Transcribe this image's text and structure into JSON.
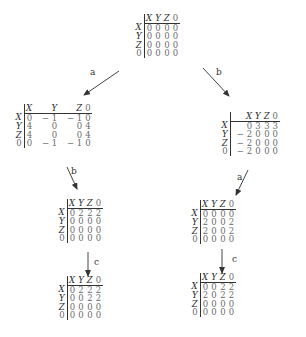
{
  "nodes": {
    "root": {
      "col_headers": [
        "X",
        "Y",
        "Z",
        "0"
      ],
      "row_headers": [
        "X",
        "Y",
        "Z",
        "0"
      ],
      "rows": [
        [
          "0",
          "0",
          "0",
          "0"
        ],
        [
          "0",
          "0",
          "0",
          "0"
        ],
        [
          "0",
          "0",
          "0",
          "0"
        ],
        [
          "0",
          "0",
          "0",
          "0"
        ]
      ]
    },
    "after_a": {
      "col_headers": [
        "X",
        "Y",
        "Z",
        "0"
      ],
      "row_headers": [
        "X",
        "Y",
        "Z",
        "0"
      ],
      "rows": [
        [
          "0",
          "− 1",
          "− 1",
          "0"
        ],
        [
          "4",
          "0",
          "0",
          "4"
        ],
        [
          "4",
          "0",
          "0",
          "4"
        ],
        [
          "0",
          "− 1",
          "− 1",
          "0"
        ]
      ]
    },
    "after_b": {
      "col_headers": [
        "X",
        "Y",
        "Z",
        "0"
      ],
      "row_headers": [
        "X",
        "Y",
        "Z",
        "0"
      ],
      "rows": [
        [
          "0",
          "3",
          "3",
          "3"
        ],
        [
          "− 2",
          "0",
          "0",
          "0"
        ],
        [
          "− 2",
          "0",
          "0",
          "0"
        ],
        [
          "− 2",
          "0",
          "0",
          "0"
        ]
      ]
    },
    "after_ab": {
      "col_headers": [
        "X",
        "Y",
        "Z",
        "0"
      ],
      "row_headers": [
        "X",
        "Y",
        "Z",
        "0"
      ],
      "rows": [
        [
          "0",
          "2",
          "2",
          "2"
        ],
        [
          "0",
          "0",
          "0",
          "0"
        ],
        [
          "0",
          "0",
          "0",
          "0"
        ],
        [
          "0",
          "0",
          "0",
          "0"
        ]
      ]
    },
    "after_abc": {
      "col_headers": [
        "X",
        "Y",
        "Z",
        "0"
      ],
      "row_headers": [
        "X",
        "Y",
        "Z",
        "0"
      ],
      "rows": [
        [
          "0",
          "2",
          "2",
          "2"
        ],
        [
          "0",
          "0",
          "2",
          "2"
        ],
        [
          "0",
          "0",
          "0",
          "0"
        ],
        [
          "0",
          "0",
          "0",
          "0"
        ]
      ]
    },
    "after_ba": {
      "col_headers": [
        "X",
        "Y",
        "Z",
        "0"
      ],
      "row_headers": [
        "X",
        "Y",
        "Z",
        "0"
      ],
      "rows": [
        [
          "0",
          "0",
          "0",
          "0"
        ],
        [
          "2",
          "0",
          "0",
          "2"
        ],
        [
          "2",
          "0",
          "0",
          "2"
        ],
        [
          "0",
          "0",
          "0",
          "0"
        ]
      ]
    },
    "after_bac": {
      "col_headers": [
        "X",
        "Y",
        "Z",
        "0"
      ],
      "row_headers": [
        "X",
        "Y",
        "Z",
        "0"
      ],
      "rows": [
        [
          "0",
          "0",
          "2",
          "2"
        ],
        [
          "2",
          "0",
          "2",
          "2"
        ],
        [
          "0",
          "0",
          "0",
          "0"
        ],
        [
          "0",
          "0",
          "0",
          "0"
        ]
      ]
    }
  },
  "edges": [
    {
      "from": "root",
      "to": "after_a",
      "label": "a"
    },
    {
      "from": "root",
      "to": "after_b",
      "label": "b"
    },
    {
      "from": "after_a",
      "to": "after_ab",
      "label": "b"
    },
    {
      "from": "after_ab",
      "to": "after_abc",
      "label": "c"
    },
    {
      "from": "after_b",
      "to": "after_ba",
      "label": "a"
    },
    {
      "from": "after_ba",
      "to": "after_bac",
      "label": "c"
    }
  ]
}
